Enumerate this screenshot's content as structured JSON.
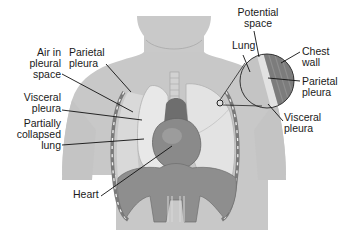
{
  "diagram": {
    "colors": {
      "skin": "#c8c8c8",
      "skin_light": "#d6d6d6",
      "lung_collapsed": "#e6e6e6",
      "lung_normal": "#e2e2e2",
      "heart": "#8a8a8a",
      "heart_dark": "#707070",
      "diaphragm": "#8c8c8c",
      "chest_wall": "#7a7a7a",
      "rib_dash": "#f0f0f0",
      "pleural_space": "#d8d8d8",
      "leader_line": "#111111",
      "text": "#1a1a1a"
    },
    "labels": {
      "air_in_pleural_space": "Air in\npleural\nspace",
      "parietal_pleura_left": "Parietal\npleura",
      "visceral_pleura_left": "Visceral\npleura",
      "partially_collapsed_lung": "Partially\ncollapsed\nlung",
      "heart": "Heart",
      "potential_space": "Potential\nspace",
      "lung": "Lung",
      "chest_wall": "Chest\nwall",
      "parietal_pleura_right": "Parietal\npleura",
      "visceral_pleura_right": "Visceral\npleura"
    },
    "inset": {
      "description": "Magnified view of normal pleura",
      "center": [
        267,
        81
      ],
      "radius": 33,
      "source_marker": [
        220,
        103
      ]
    }
  }
}
